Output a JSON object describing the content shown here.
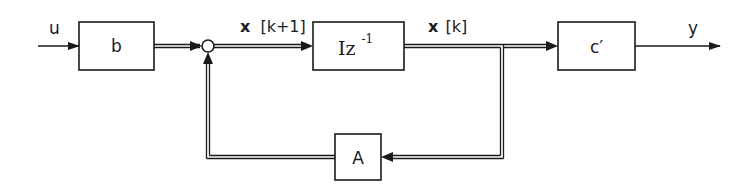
{
  "diagram": {
    "type": "state-space block diagram (discrete-time)",
    "colors": {
      "stroke": "#1a1a1a",
      "background": "#ffffff"
    },
    "signals": {
      "input": "u",
      "output": "y",
      "next_state": {
        "vec": "x",
        "index": "[k+1]"
      },
      "state": {
        "vec": "x",
        "index": "[k]"
      }
    },
    "blocks": {
      "b": {
        "label": "b"
      },
      "delay": {
        "label_main": "Iz",
        "label_sup": "-1"
      },
      "c": {
        "label": "c′"
      },
      "A": {
        "label": "A"
      }
    },
    "junctions": {
      "sum": "summing-junction",
      "branch": "take-off-point"
    },
    "edges": [
      {
        "from": "u",
        "to": "b",
        "style": "single"
      },
      {
        "from": "b",
        "to": "sum",
        "style": "double"
      },
      {
        "from": "sum",
        "to": "delay",
        "style": "double",
        "label": "x[k+1]"
      },
      {
        "from": "delay",
        "to": "branch",
        "style": "double",
        "label": "x[k]"
      },
      {
        "from": "branch",
        "to": "c",
        "style": "double"
      },
      {
        "from": "c",
        "to": "y",
        "style": "single"
      },
      {
        "from": "branch",
        "to": "A",
        "style": "double"
      },
      {
        "from": "A",
        "to": "sum",
        "style": "double"
      }
    ]
  }
}
